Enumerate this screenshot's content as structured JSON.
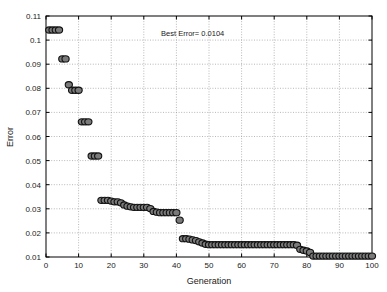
{
  "chart_data": {
    "type": "scatter",
    "title": "",
    "xlabel": "Generation",
    "ylabel": "Error",
    "xlim": [
      0,
      100
    ],
    "ylim": [
      0.01,
      0.11
    ],
    "xticks": [
      0,
      10,
      20,
      30,
      40,
      50,
      60,
      70,
      80,
      90,
      100
    ],
    "yticks": [
      0.01,
      0.02,
      0.03,
      0.04,
      0.05,
      0.06,
      0.07,
      0.08,
      0.09,
      0.1,
      0.11
    ],
    "xtick_labels": [
      "0",
      "10",
      "20",
      "30",
      "40",
      "50",
      "60",
      "70",
      "80",
      "90",
      "100"
    ],
    "ytick_labels": [
      "0.01",
      "0.02",
      "0.03",
      "0.04",
      "0.05",
      "0.06",
      "0.07",
      "0.08",
      "0.09",
      "0.1",
      "0.11"
    ],
    "grid": true,
    "legend": null,
    "marker_style": "filled-circle",
    "marker_fill": "#7a7a7a",
    "marker_edge": "#111111",
    "annotations": [
      {
        "text": "Best Error= 0.0104",
        "x": 45,
        "y": 0.1018
      }
    ],
    "series": [
      {
        "name": "Best Error per Generation",
        "x": [
          1,
          2,
          3,
          4,
          5,
          6,
          7,
          8,
          9,
          10,
          11,
          12,
          13,
          14,
          15,
          16,
          17,
          18,
          19,
          20,
          21,
          22,
          23,
          24,
          25,
          26,
          27,
          28,
          29,
          30,
          31,
          32,
          33,
          34,
          35,
          36,
          37,
          38,
          39,
          40,
          41,
          42,
          43,
          44,
          45,
          46,
          47,
          48,
          49,
          50,
          51,
          52,
          53,
          54,
          55,
          56,
          57,
          58,
          59,
          60,
          61,
          62,
          63,
          64,
          65,
          66,
          67,
          68,
          69,
          70,
          71,
          72,
          73,
          74,
          75,
          76,
          77,
          78,
          79,
          80,
          81,
          82,
          83,
          84,
          85,
          86,
          87,
          88,
          89,
          90,
          91,
          92,
          93,
          94,
          95,
          96,
          97,
          98,
          99,
          100
        ],
        "values": [
          0.1042,
          0.1042,
          0.1042,
          0.1042,
          0.0922,
          0.0922,
          0.0815,
          0.0792,
          0.0792,
          0.0792,
          0.0661,
          0.0661,
          0.0661,
          0.0519,
          0.0519,
          0.0519,
          0.0335,
          0.0335,
          0.0335,
          0.0332,
          0.0329,
          0.0329,
          0.0325,
          0.0316,
          0.0311,
          0.0308,
          0.0306,
          0.0306,
          0.0306,
          0.0306,
          0.0306,
          0.0301,
          0.0289,
          0.0286,
          0.0284,
          0.0284,
          0.0284,
          0.0284,
          0.0284,
          0.0284,
          0.0253,
          0.0176,
          0.0176,
          0.0174,
          0.0171,
          0.0168,
          0.0163,
          0.0158,
          0.0153,
          0.0151,
          0.0151,
          0.0151,
          0.0151,
          0.0151,
          0.0151,
          0.0151,
          0.0151,
          0.0151,
          0.0151,
          0.0151,
          0.0151,
          0.0151,
          0.0151,
          0.0151,
          0.0151,
          0.0151,
          0.0151,
          0.0151,
          0.0151,
          0.0151,
          0.0151,
          0.0151,
          0.0151,
          0.0151,
          0.0151,
          0.0151,
          0.0149,
          0.0132,
          0.0128,
          0.0125,
          0.0119,
          0.0104,
          0.0104,
          0.0104,
          0.0104,
          0.0104,
          0.0104,
          0.0104,
          0.0104,
          0.0104,
          0.0104,
          0.0104,
          0.0104,
          0.0104,
          0.0104,
          0.0104,
          0.0104,
          0.0104,
          0.0104,
          0.0104
        ]
      }
    ]
  },
  "figure": {
    "background": "#ffffff",
    "axes_color": "#000000",
    "grid_color": "#9a9a9a"
  }
}
